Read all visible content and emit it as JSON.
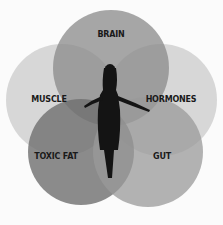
{
  "diagram": {
    "type": "venn",
    "sets": [
      {
        "id": "brain",
        "label": "BRAIN",
        "color": "#8a8a8a",
        "opacity": 0.75
      },
      {
        "id": "muscle",
        "label": "MUSCLE",
        "color": "#c8c8c8",
        "opacity": 0.7
      },
      {
        "id": "hormones",
        "label": "HORMONES",
        "color": "#c8c8c8",
        "opacity": 0.7
      },
      {
        "id": "toxic_fat",
        "label": "TOXIC FAT",
        "color": "#6f6f6f",
        "opacity": 0.8
      },
      {
        "id": "gut",
        "label": "GUT",
        "color": "#9a9a9a",
        "opacity": 0.75
      }
    ],
    "center_figure": "woman-silhouette",
    "figure_color": "#141414"
  }
}
